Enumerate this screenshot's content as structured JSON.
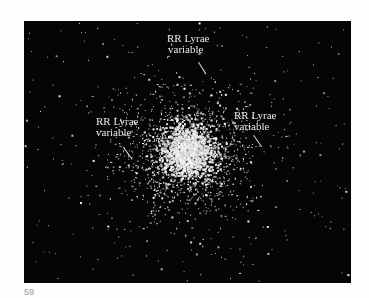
{
  "figure": {
    "background_color": "#050505",
    "star_color": "#ffffff",
    "annotations": [
      {
        "line1": "RR Lyrae",
        "line2": "variable",
        "position": "top"
      },
      {
        "line1": "RR Lyrae",
        "line2": "variable",
        "position": "left"
      },
      {
        "line1": "RR Lyrae",
        "line2": "variable",
        "position": "right"
      }
    ],
    "figure_number": "59"
  }
}
